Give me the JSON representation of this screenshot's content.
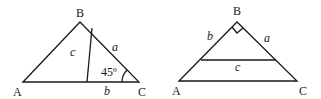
{
  "left_figure": {
    "vertices": {
      "A": "A",
      "B": "B",
      "C": "C"
    },
    "sides": {
      "c": "c",
      "a": "a",
      "b": "b"
    },
    "angle_C": "45º"
  },
  "right_figure": {
    "vertices": {
      "A": "A",
      "B": "B",
      "C": "C"
    },
    "sides": {
      "b": "b",
      "a": "a",
      "c": "c"
    },
    "right_angle_at": "B"
  },
  "colors": {
    "stroke": "#1a1a1a",
    "background": "#ffffff"
  }
}
